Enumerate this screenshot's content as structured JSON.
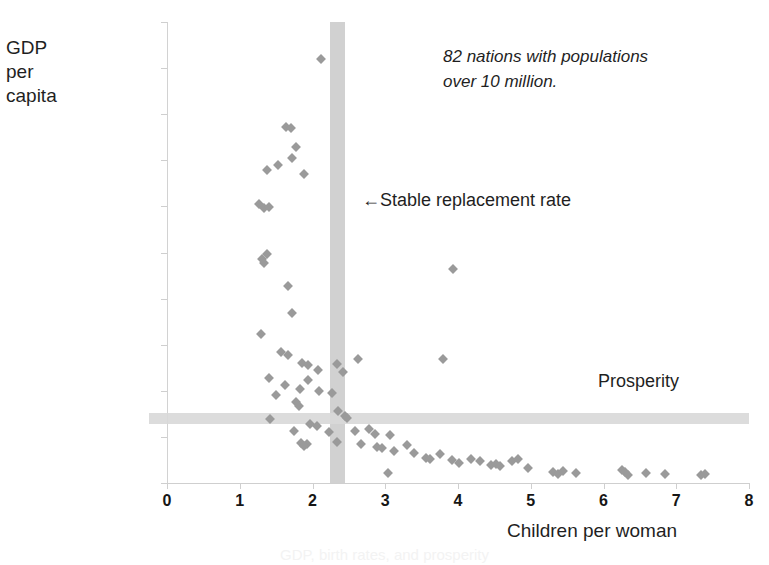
{
  "chart_data": {
    "type": "scatter",
    "title": "",
    "xlabel": "Children per woman",
    "ylabel": "GDP per capita",
    "ylabel_lines": "GDP\nper\ncapita",
    "xlim": [
      0,
      8
    ],
    "ylim": [
      0,
      50000
    ],
    "xticks": [
      "0",
      "1",
      "2",
      "3",
      "4",
      "5",
      "6",
      "7",
      "8"
    ],
    "xtick_values": [
      0,
      1,
      2,
      3,
      4,
      5,
      6,
      7,
      8
    ],
    "yticks": [
      "$0",
      "$5,000",
      "$10,000",
      "$15,000",
      "$20,000",
      "$25,000",
      "$30,000",
      "$35,000",
      "$40,000",
      "$45,000",
      "$50,000"
    ],
    "ytick_values": [
      0,
      5000,
      10000,
      15000,
      20000,
      25000,
      30000,
      35000,
      40000,
      45000,
      50000
    ],
    "grid": false,
    "legend": "none",
    "marker": "diamond",
    "marker_color": "#9a9a9a",
    "annotations": [
      {
        "name": "nations-note",
        "text": "82 nations with populations\nover 10 million.",
        "style": "italic",
        "x": 3.8,
        "y": 46500
      },
      {
        "name": "replacement-rate-note",
        "text": "←Stable replacement rate",
        "x": 2.7,
        "y": 30000
      },
      {
        "name": "prosperity-note",
        "text": "Prosperity",
        "x": 6.0,
        "y": 9000
      }
    ],
    "reference_bands": [
      {
        "name": "stable-replacement-rate",
        "orientation": "vertical",
        "value": 2.33,
        "color": "#c9c9c9"
      },
      {
        "name": "prosperity-threshold",
        "orientation": "horizontal",
        "value": 7000,
        "color": "#d8d8d8"
      }
    ],
    "points": [
      [
        2.12,
        46000
      ],
      [
        1.64,
        38600
      ],
      [
        1.7,
        38500
      ],
      [
        1.78,
        36400
      ],
      [
        1.72,
        35300
      ],
      [
        1.37,
        34000
      ],
      [
        1.52,
        34500
      ],
      [
        1.88,
        33500
      ],
      [
        1.26,
        30300
      ],
      [
        1.33,
        29800
      ],
      [
        1.4,
        29900
      ],
      [
        1.3,
        24300
      ],
      [
        1.34,
        23900
      ],
      [
        1.38,
        24800
      ],
      [
        1.66,
        21400
      ],
      [
        1.72,
        18400
      ],
      [
        1.29,
        16200
      ],
      [
        1.57,
        14200
      ],
      [
        1.66,
        13900
      ],
      [
        1.86,
        13000
      ],
      [
        1.94,
        12800
      ],
      [
        2.33,
        12900
      ],
      [
        2.62,
        13400
      ],
      [
        2.08,
        12300
      ],
      [
        2.42,
        12000
      ],
      [
        1.4,
        11400
      ],
      [
        1.94,
        11200
      ],
      [
        1.62,
        10600
      ],
      [
        1.83,
        10200
      ],
      [
        2.09,
        10000
      ],
      [
        2.27,
        9800
      ],
      [
        1.5,
        9500
      ],
      [
        1.78,
        8800
      ],
      [
        1.81,
        8400
      ],
      [
        2.35,
        7800
      ],
      [
        2.44,
        7300
      ],
      [
        2.48,
        7000
      ],
      [
        1.42,
        6900
      ],
      [
        1.96,
        6400
      ],
      [
        2.06,
        6200
      ],
      [
        1.74,
        5600
      ],
      [
        2.23,
        5500
      ],
      [
        2.58,
        5600
      ],
      [
        2.77,
        5900
      ],
      [
        2.86,
        5300
      ],
      [
        3.06,
        5200
      ],
      [
        1.84,
        4300
      ],
      [
        1.92,
        4200
      ],
      [
        1.88,
        4000
      ],
      [
        2.33,
        4400
      ],
      [
        2.66,
        4200
      ],
      [
        2.88,
        3900
      ],
      [
        2.95,
        3800
      ],
      [
        3.12,
        3500
      ],
      [
        3.8,
        13400
      ],
      [
        3.93,
        23200
      ],
      [
        3.04,
        1100
      ],
      [
        3.3,
        4100
      ],
      [
        3.4,
        3300
      ],
      [
        3.56,
        2700
      ],
      [
        3.62,
        2600
      ],
      [
        3.75,
        3100
      ],
      [
        3.92,
        2500
      ],
      [
        4.02,
        2200
      ],
      [
        4.18,
        2600
      ],
      [
        4.3,
        2400
      ],
      [
        4.46,
        1900
      ],
      [
        4.52,
        2100
      ],
      [
        4.58,
        1800
      ],
      [
        4.74,
        2400
      ],
      [
        4.82,
        2600
      ],
      [
        4.96,
        1600
      ],
      [
        5.3,
        1200
      ],
      [
        5.38,
        1000
      ],
      [
        5.45,
        1300
      ],
      [
        5.62,
        1100
      ],
      [
        6.26,
        1400
      ],
      [
        6.3,
        1200
      ],
      [
        6.33,
        900
      ],
      [
        6.58,
        1100
      ],
      [
        6.84,
        1000
      ],
      [
        7.34,
        900
      ],
      [
        7.4,
        1000
      ]
    ],
    "point_count": 82
  },
  "caption": {
    "text": "GDP, birth rates, and prosperity"
  }
}
